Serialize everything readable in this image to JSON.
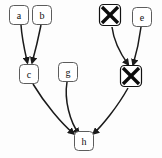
{
  "diagram": {
    "background_color": "#fdfdfd",
    "node_fill": "#ffffff",
    "node_stroke": "#4a4a4a",
    "edge_color": "#1a1a1a",
    "blocked_mark_color": "#0c0c0c",
    "nodes": [
      {
        "id": "a",
        "label": "a",
        "x": 19,
        "y": 15,
        "w": 19,
        "h": 19,
        "state": "normal"
      },
      {
        "id": "b",
        "label": "b",
        "x": 42,
        "y": 15,
        "w": 19,
        "h": 19,
        "state": "normal"
      },
      {
        "id": "x1",
        "label": "",
        "x": 110,
        "y": 15,
        "w": 21,
        "h": 21,
        "state": "blocked"
      },
      {
        "id": "e",
        "label": "e",
        "x": 142,
        "y": 17,
        "w": 19,
        "h": 19,
        "state": "normal"
      },
      {
        "id": "c",
        "label": "c",
        "x": 29,
        "y": 74,
        "w": 19,
        "h": 19,
        "state": "normal"
      },
      {
        "id": "g",
        "label": "g",
        "x": 68,
        "y": 72,
        "w": 19,
        "h": 19,
        "state": "normal"
      },
      {
        "id": "x2",
        "label": "",
        "x": 131,
        "y": 76,
        "w": 21,
        "h": 21,
        "state": "blocked"
      },
      {
        "id": "h",
        "label": "h",
        "x": 84,
        "y": 141,
        "w": 19,
        "h": 19,
        "state": "normal"
      }
    ],
    "edges": [
      {
        "from": "a",
        "to": "c",
        "d": "M 21,25 C 22,40 25,52 27.5,63"
      },
      {
        "from": "b",
        "to": "c",
        "d": "M 41,25 C 38,40 35,52 32,63"
      },
      {
        "from": "x1",
        "to": "x2",
        "d": "M 112,27 C 114,44 122,56 128.5,65"
      },
      {
        "from": "e",
        "to": "x2",
        "d": "M 141,27 C 139,43 136,55 133,65"
      },
      {
        "from": "c",
        "to": "h",
        "d": "M 33,84 C 45,104 62,124 74,134"
      },
      {
        "from": "g",
        "to": "h",
        "d": "M 67,82 C 64,100 70,122 79,134"
      },
      {
        "from": "x2",
        "to": "h",
        "d": "M 128,88 C 118,106 102,126 93,134"
      }
    ],
    "edge_count": 7,
    "node_count": 8
  }
}
